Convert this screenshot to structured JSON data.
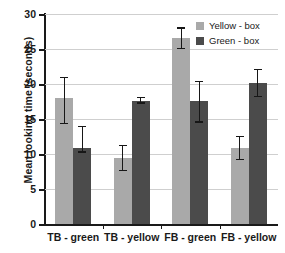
{
  "chart_data": {
    "type": "bar",
    "title": "",
    "xlabel": "",
    "ylabel": "Mean looking time (seconds)",
    "categories": [
      "TB - green",
      "TB - yellow",
      "FB - green",
      "FB - yellow"
    ],
    "ylim": [
      0,
      30
    ],
    "yticks": [
      0,
      5,
      10,
      15,
      20,
      25,
      30
    ],
    "ytick_labels": [
      "0",
      "5",
      "10",
      "15",
      "20",
      "25",
      "30"
    ],
    "grid": true,
    "legend_position": "top-right",
    "series": [
      {
        "name": "Yellow - box",
        "color": "#a9a9a9",
        "values": [
          18.0,
          9.4,
          26.6,
          10.9
        ],
        "error_low": [
          14.3,
          7.5,
          25.0,
          9.1
        ],
        "error_high": [
          21.0,
          11.3,
          28.1,
          12.6
        ]
      },
      {
        "name": "Green - box",
        "color": "#4b4b4b",
        "values": [
          10.9,
          17.6,
          17.6,
          20.1
        ],
        "error_low": [
          10.2,
          17.2,
          14.5,
          18.1
        ],
        "error_high": [
          14.0,
          18.2,
          20.5,
          22.2
        ]
      }
    ]
  },
  "legend": {
    "items": [
      {
        "label": "Yellow - box"
      },
      {
        "label": "Green - box"
      }
    ]
  }
}
